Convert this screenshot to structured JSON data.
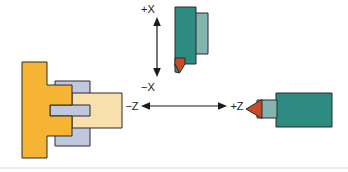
{
  "figure": {
    "background_color": "#ffffff"
  },
  "axes": {
    "vertical": {
      "name": "X axis",
      "positive_label": "+X",
      "negative_label": "−X",
      "orientation": "vertical",
      "arrowheads": "both"
    },
    "horizontal": {
      "name": "Z axis",
      "positive_label": "+Z",
      "negative_label": "−Z",
      "orientation": "horizontal",
      "arrowheads": "both"
    }
  },
  "colors": {
    "chuck_body": "#F5B433",
    "chuck_shade": "#E8A62B",
    "workpiece": "#F7DFAE",
    "jaw": "#BFC8DC",
    "jaw_shade": "#AEB8CE",
    "tool_body_dark": "#2E8B82",
    "tool_body_light": "#84B4B1",
    "insert_tip": "#C94A28",
    "insert_tip_light": "#E0694A",
    "outline": "#2b2b2b",
    "label_text": "#1a1a1a",
    "rule": "#d8d8d8"
  },
  "parts": {
    "chuck": {
      "label": "chuck",
      "color_key": "chuck_body"
    },
    "chuck_jaws": {
      "label": "chuck jaws",
      "color_key": "jaw"
    },
    "workpiece": {
      "label": "workpiece",
      "color_key": "workpiece"
    },
    "facing_tool": {
      "label": "facing tool on X axis",
      "body_color_key": "tool_body_dark",
      "holder_color_key": "tool_body_light",
      "tip_color_key": "insert_tip"
    },
    "turning_tool": {
      "label": "turning tool on Z axis",
      "body_color_key": "tool_body_dark",
      "shank_color_key": "tool_body_light",
      "tip_color_key": "insert_tip"
    }
  }
}
